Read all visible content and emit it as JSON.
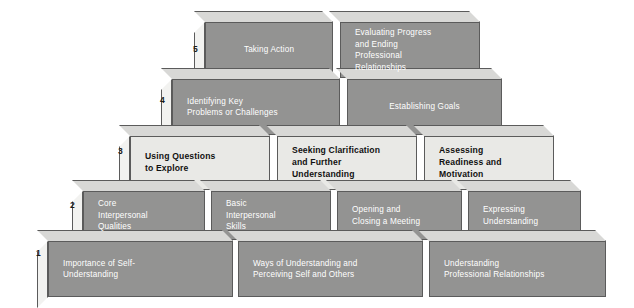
{
  "diagram": {
    "colors": {
      "dark_block": "#939392",
      "light_block": "#e9e9e6",
      "side_face": "#f2f2f0",
      "top_face": "#d8d8d6",
      "outline": "#5b5b5b",
      "dark_block_text": "#ffffff",
      "light_block_text": "#111111",
      "background": "#ffffff"
    },
    "levels": [
      {
        "number": "5",
        "shade": "dark",
        "blocks": [
          {
            "text": "Taking Action",
            "align": "center"
          },
          {
            "text": "Evaluating Progress\nand Ending\nProfessional\nRelationships",
            "align": "left"
          }
        ]
      },
      {
        "number": "4",
        "shade": "dark",
        "blocks": [
          {
            "text": "Identifying Key\nProblems or Challenges",
            "align": "left"
          },
          {
            "text": "Establishing Goals",
            "align": "center"
          }
        ]
      },
      {
        "number": "3",
        "shade": "light",
        "blocks": [
          {
            "text": "Using Questions\nto Explore",
            "align": "left"
          },
          {
            "text": "Seeking Clarification\nand Further\nUnderstanding",
            "align": "left"
          },
          {
            "text": "Assessing\nReadiness and\nMotivation",
            "align": "left"
          }
        ]
      },
      {
        "number": "2",
        "shade": "dark",
        "blocks": [
          {
            "text": "Core\nInterpersonal\nQualities",
            "align": "left"
          },
          {
            "text": "Basic\nInterpersonal\nSkills",
            "align": "left"
          },
          {
            "text": "Opening and\nClosing a Meeting",
            "align": "left"
          },
          {
            "text": "Expressing\nUnderstanding",
            "align": "left"
          }
        ]
      },
      {
        "number": "1",
        "shade": "dark",
        "blocks": [
          {
            "text": "Importance of Self-\nUnderstanding",
            "align": "left"
          },
          {
            "text": "Ways of Understanding and\nPerceiving Self and Others",
            "align": "left"
          },
          {
            "text": "Understanding\nProfessional Relationships",
            "align": "left"
          }
        ]
      }
    ]
  }
}
